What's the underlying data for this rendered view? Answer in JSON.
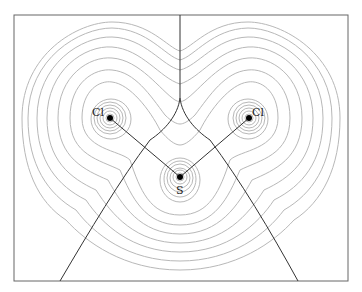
{
  "figure": {
    "type": "electron density contour map with zero-flux boundaries",
    "atoms": [
      {
        "id": "cl_left",
        "label": "Cl",
        "x": 110,
        "y": 118
      },
      {
        "id": "cl_right",
        "label": "Cl",
        "x": 249,
        "y": 118
      },
      {
        "id": "s",
        "label": "S",
        "x": 180,
        "y": 177
      }
    ],
    "bonds": [
      [
        "s",
        "cl_left"
      ],
      [
        "s",
        "cl_right"
      ]
    ],
    "colors": {
      "contour": "#b5b5b5",
      "boundary": "#333333",
      "frame": "#555555",
      "atom": "#000000"
    }
  }
}
